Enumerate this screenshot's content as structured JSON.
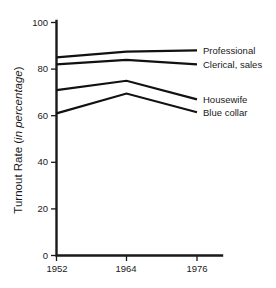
{
  "chart_data": {
    "type": "line",
    "title": "",
    "xlabel": "",
    "ylabel": "Turnout Rate (in percentage)",
    "ylabel_plain": "Turnout Rate (",
    "ylabel_italic": "in percentage",
    "ylabel_close": ")",
    "x": [
      "1952",
      "1964",
      "1976"
    ],
    "xticklabels": [
      "1952",
      "1964",
      "1976"
    ],
    "yticklabels": [
      "0",
      "20",
      "40",
      "60",
      "80",
      "100"
    ],
    "yticks": [
      0,
      20,
      40,
      60,
      80,
      100
    ],
    "ylim": [
      0,
      100
    ],
    "grid": false,
    "legend_position": "right-inline-labels",
    "series": [
      {
        "name": "Professional",
        "values": [
          85.0,
          87.5,
          88.0
        ]
      },
      {
        "name": "Clerical, sales",
        "values": [
          82.0,
          84.0,
          82.0
        ]
      },
      {
        "name": "Housewife",
        "values": [
          71.0,
          75.0,
          67.0
        ]
      },
      {
        "name": "Blue collar",
        "values": [
          61.0,
          69.5,
          61.5
        ]
      }
    ],
    "annotations": [
      {
        "text": "Professional",
        "at_x": "1976",
        "at_y": 88.0
      },
      {
        "text": "Clerical, sales",
        "at_x": "1976",
        "at_y": 82.0
      },
      {
        "text": "Housewife",
        "at_x": "1976",
        "at_y": 67.0
      },
      {
        "text": "Blue collar",
        "at_x": "1976",
        "at_y": 61.5
      }
    ],
    "colors": {
      "line": "#111111",
      "axis": "#1a1a1a",
      "background": "#ffffff"
    }
  }
}
